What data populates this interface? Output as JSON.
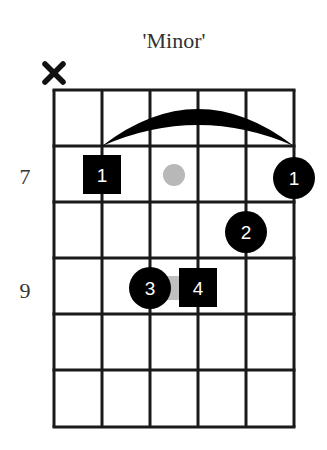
{
  "title": "'Minor'",
  "colors": {
    "grid": "#1a1a1a",
    "marker": "#000000",
    "marker_text": "#ffffff",
    "ghost": "#b8b8b8",
    "label": "#333333",
    "background": "#ffffff"
  },
  "grid": {
    "strings": 6,
    "frets": 6,
    "origin_x": 54,
    "origin_y": 90,
    "string_spacing": 48,
    "fret_spacing": 56.2
  },
  "muted_strings": [
    {
      "string": 1,
      "symbol": "x-icon"
    }
  ],
  "fret_labels": [
    {
      "text": "7",
      "row": 1
    },
    {
      "text": "9",
      "row": 3
    }
  ],
  "barre": {
    "from_string": 2,
    "to_string": 6,
    "fret_row": 1,
    "label": "barre"
  },
  "markers": [
    {
      "finger": "1",
      "string": 2,
      "row": 1,
      "shape": "square",
      "role": "root"
    },
    {
      "finger": "1",
      "string": 6,
      "row": 1,
      "shape": "circle",
      "role": "note"
    },
    {
      "finger": "2",
      "string": 5,
      "row": 2,
      "shape": "circle",
      "role": "note"
    },
    {
      "finger": "3",
      "string": 3,
      "row": 3,
      "shape": "circle",
      "role": "note"
    },
    {
      "finger": "4",
      "string": 4,
      "row": 3,
      "shape": "square",
      "role": "root"
    }
  ],
  "ghost_notes": [
    {
      "between_strings": [
        3,
        4
      ],
      "row": 1,
      "shape": "dot"
    },
    {
      "between_strings": [
        3,
        4
      ],
      "row": 3,
      "shape": "connector"
    }
  ],
  "labels": {
    "fret_7": "7",
    "fret_9": "9",
    "marker_1_square": "1",
    "marker_1_circle": "1",
    "marker_2": "2",
    "marker_3": "3",
    "marker_4": "4"
  }
}
